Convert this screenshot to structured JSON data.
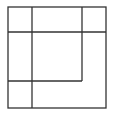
{
  "diagram": {
    "width": 116,
    "height": 113,
    "stroke_color": "#333333",
    "stroke_width": 1.3,
    "outer_box": {
      "x": 8,
      "y": 7,
      "w": 98,
      "h": 101
    },
    "lines": [
      {
        "id": "vertical-left",
        "x1": 32,
        "y1": 7,
        "x2": 32,
        "y2": 108
      },
      {
        "id": "horizontal-top",
        "x1": 8,
        "y1": 32,
        "x2": 106,
        "y2": 32
      },
      {
        "id": "vertical-inner-right",
        "x1": 82,
        "y1": 7,
        "x2": 82,
        "y2": 81
      },
      {
        "id": "horizontal-inner-bottom",
        "x1": 8,
        "y1": 81,
        "x2": 82,
        "y2": 81
      }
    ]
  }
}
